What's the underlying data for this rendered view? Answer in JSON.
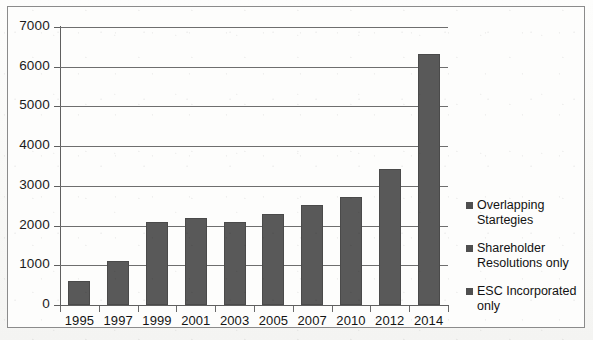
{
  "chart_data": {
    "type": "bar",
    "title": "",
    "xlabel": "",
    "ylabel": "",
    "categories": [
      "1995",
      "1997",
      "1999",
      "2001",
      "2003",
      "2005",
      "2007",
      "2010",
      "2012",
      "2014"
    ],
    "values": [
      600,
      1110,
      2100,
      2200,
      2100,
      2280,
      2530,
      2730,
      3420,
      6330
    ],
    "ylim": [
      0,
      7000
    ],
    "y_ticks": [
      "7000",
      "6000",
      "5000",
      "4000",
      "3000",
      "2000",
      "1000",
      "0"
    ],
    "grid": true,
    "legend_position": "right",
    "series": [
      {
        "name": "Overlapping Startegies"
      },
      {
        "name": "Shareholder Resolutions only"
      },
      {
        "name": "ESC Incorporated only"
      }
    ],
    "bar_color": "#595959"
  },
  "legend": {
    "items": [
      {
        "line1": "Overlapping",
        "line2": "Startegies"
      },
      {
        "line1": "Shareholder",
        "line2": "Resolutions only"
      },
      {
        "line1": "ESC Incorporated",
        "line2": "only"
      }
    ]
  }
}
